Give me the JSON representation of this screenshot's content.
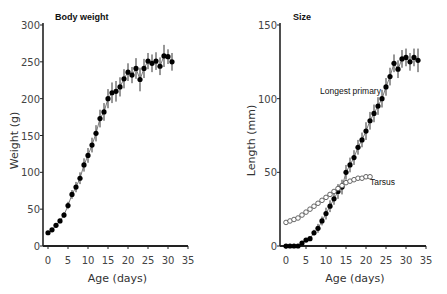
{
  "chart_data": [
    {
      "type": "line",
      "title": "Body weight",
      "xlabel": "Age (days)",
      "ylabel": "Weight (g)",
      "xlim": [
        0,
        35
      ],
      "ylim": [
        0,
        300
      ],
      "xticks": [
        0,
        5,
        10,
        15,
        20,
        25,
        30,
        35
      ],
      "yticks": [
        0,
        50,
        100,
        150,
        200,
        250,
        300
      ],
      "grid": false,
      "series": [
        {
          "name": "Body weight",
          "marker": "filled-circle",
          "error_bars": true,
          "x": [
            0,
            1,
            2,
            3,
            4,
            5,
            6,
            7,
            8,
            9,
            10,
            11,
            12,
            13,
            14,
            15,
            16,
            17,
            18,
            19,
            20,
            21,
            22,
            23,
            24,
            25,
            26,
            27,
            28,
            29,
            30,
            31
          ],
          "values": [
            18,
            22,
            28,
            34,
            42,
            55,
            70,
            80,
            92,
            110,
            123,
            137,
            153,
            173,
            182,
            200,
            208,
            210,
            216,
            227,
            236,
            232,
            241,
            226,
            241,
            251,
            248,
            251,
            244,
            258,
            257,
            250
          ],
          "err": [
            2,
            2,
            3,
            3,
            4,
            5,
            6,
            7,
            8,
            9,
            10,
            10,
            11,
            12,
            12,
            13,
            14,
            14,
            13,
            13,
            12,
            11,
            14,
            16,
            13,
            11,
            12,
            12,
            12,
            15,
            10,
            12
          ]
        }
      ]
    },
    {
      "type": "line",
      "title": "Size",
      "xlabel": "Age (days)",
      "ylabel": "Length (mm)",
      "xlim": [
        0,
        35
      ],
      "ylim": [
        0,
        150
      ],
      "xticks": [
        0,
        5,
        10,
        15,
        20,
        25,
        30,
        35
      ],
      "yticks": [
        0,
        50,
        100,
        150
      ],
      "grid": false,
      "annotations": [
        "Longest primary",
        "Tarsus"
      ],
      "series": [
        {
          "name": "Longest primary",
          "marker": "filled-circle",
          "error_bars": true,
          "x": [
            0,
            1,
            2,
            3,
            4,
            5,
            6,
            7,
            8,
            9,
            10,
            11,
            12,
            13,
            14,
            15,
            16,
            17,
            18,
            19,
            20,
            21,
            22,
            23,
            24,
            25,
            26,
            27,
            28,
            29,
            30,
            31,
            32,
            33
          ],
          "values": [
            0,
            0,
            0,
            0,
            2,
            4,
            5,
            9,
            12,
            17,
            22,
            27,
            32,
            37,
            40,
            50,
            55,
            60,
            67,
            72,
            78,
            85,
            90,
            95,
            100,
            108,
            115,
            124,
            120,
            127,
            128,
            125,
            128,
            126
          ],
          "err": [
            0.5,
            0.5,
            0.5,
            0.5,
            1,
            1,
            1,
            2,
            3,
            3,
            4,
            4,
            4,
            5,
            5,
            5,
            5,
            5,
            5,
            5,
            6,
            6,
            6,
            6,
            6,
            6,
            6,
            6,
            6,
            6,
            6,
            6,
            6,
            8
          ]
        },
        {
          "name": "Tarsus",
          "marker": "open-circle",
          "error_bars": false,
          "x": [
            0,
            1,
            2,
            3,
            4,
            5,
            6,
            7,
            8,
            9,
            10,
            11,
            12,
            13,
            14,
            15,
            16,
            17,
            18,
            19,
            20,
            21
          ],
          "values": [
            16,
            17,
            18,
            19,
            21,
            23,
            25,
            27,
            29,
            31,
            33,
            35,
            37,
            39,
            41,
            43,
            44,
            45,
            46,
            46,
            47,
            47
          ]
        }
      ]
    }
  ]
}
